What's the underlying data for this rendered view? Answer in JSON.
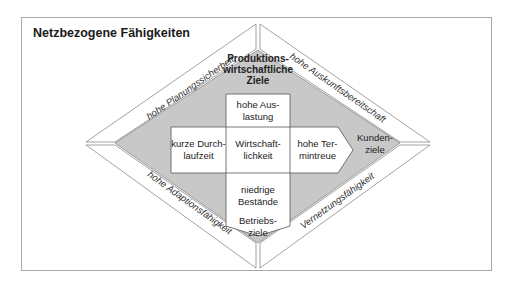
{
  "title": "Netzbezogene Fähigkeiten",
  "colors": {
    "frame_border": "#a8a8a8",
    "band_fill": "#ffffff",
    "band_stroke": "#8a8a8a",
    "inner_fill": "#c8c8c8",
    "box_fill": "#ffffff",
    "box_stroke": "#555555"
  },
  "bands": {
    "top_left": "hohe Planungssicherheit",
    "top_right": "hohe Auskunftsbereitschaft",
    "bottom_left": "hohe Adaptionsfähigkeit",
    "bottom_right": "Vernetzungsfähigkeit"
  },
  "corner_goals": {
    "top": [
      "Produktions-",
      "wirtschaftliche",
      "Ziele"
    ],
    "right": [
      "Kunden-",
      "ziele"
    ],
    "bottom": [
      "Betriebs-",
      "ziele"
    ]
  },
  "cross": {
    "top": [
      "hohe Aus-",
      "lastung"
    ],
    "left": [
      "kurze Durch-",
      "laufzeit"
    ],
    "center": [
      "Wirtschaft-",
      "lichkeit"
    ],
    "right": [
      "hohe Ter-",
      "mintreue"
    ],
    "bottom": [
      "niedrige",
      "Bestände"
    ]
  }
}
